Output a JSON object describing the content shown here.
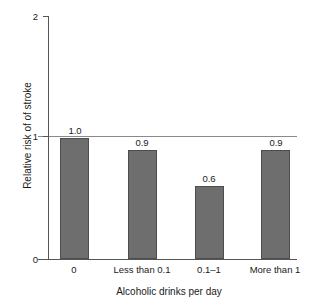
{
  "chart_data": {
    "type": "bar",
    "title": "",
    "categories": [
      "0",
      "Less than 0.1",
      "0.1–1",
      "More than 1"
    ],
    "values": [
      1.0,
      0.9,
      0.6,
      0.9
    ],
    "value_labels": [
      "1.0",
      "0.9",
      "0.6",
      "0.9"
    ],
    "xlabel": "Alcoholic drinks per day",
    "ylabel": "Relative risk of of stroke",
    "ylim": [
      0,
      2
    ],
    "ytick_labels": [
      "0",
      "1",
      "2"
    ],
    "ytick_values": [
      0,
      1,
      2
    ],
    "grid": false,
    "legend": null,
    "annotations": [
      {
        "kind": "reference-line",
        "axis": "y",
        "value": 1,
        "label": ""
      }
    ],
    "style": {
      "bar_fill": "#6e6e6e",
      "bar_border": "#4d4d4d",
      "axis_color": "#555555",
      "reference_line_color": "#8a8a8a",
      "text_color": "#1a1a1a",
      "background": "#ffffff"
    }
  }
}
